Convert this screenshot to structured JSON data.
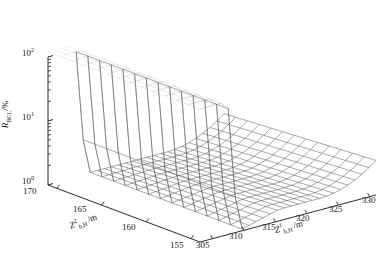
{
  "figure": {
    "background_color": "#ffffff",
    "mesh_color": "#555555",
    "axis_color": "#2b2b2b",
    "width": 391,
    "height": 258
  },
  "chart_data": {
    "type": "surface",
    "title": "",
    "zlabel": "R_BCL/%",
    "zlabel_parts": {
      "base": "R",
      "sub": "BCL",
      "unit": "/%"
    },
    "zscale": "log",
    "ztick_labels": [
      "10^0",
      "10^1",
      "10^2"
    ],
    "ztick_values": [
      1,
      10,
      100
    ],
    "zlim": [
      1,
      100
    ],
    "xlabel": "Z^1_b,H /m",
    "xlabel_parts": {
      "base": "Z",
      "sup": "1",
      "sub": "b,H",
      "unit": "/m"
    },
    "xtick_labels": [
      "305",
      "310",
      "315",
      "320",
      "325",
      "330"
    ],
    "xtick_values": [
      305,
      310,
      315,
      320,
      325,
      330
    ],
    "xlim": [
      303,
      331
    ],
    "ylabel": "Z^2_b,H /m",
    "ylabel_parts": {
      "base": "Z",
      "sup": "2",
      "sub": "b,H",
      "unit": "/m"
    },
    "ytick_labels": [
      "170",
      "165",
      "160",
      "155"
    ],
    "ytick_values": [
      170,
      165,
      160,
      155
    ],
    "ylim": [
      154,
      171
    ],
    "grid": true,
    "legend": false,
    "surface_mesh": {
      "nx": 26,
      "ny": 14,
      "x_range": [
        303,
        331
      ],
      "y_range": [
        154,
        171
      ],
      "plateau_value": 120,
      "valley_value": 1.05,
      "cliff_x_start": 307.0,
      "cliff_x_end": 309.6,
      "rise_x_start": 322.0,
      "rise_end_value": 2.4
    }
  }
}
